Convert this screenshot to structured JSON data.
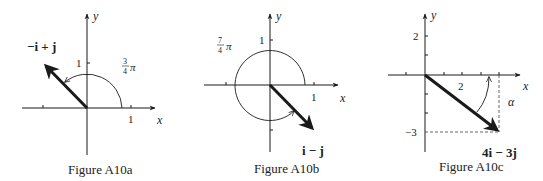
{
  "figures": [
    {
      "caption": "Figure A10a",
      "axis_x": "x",
      "axis_y": "y",
      "tick_x": "1",
      "tick_y": "1",
      "vector_label": "−i + j",
      "angle_num": "3",
      "angle_den": "4",
      "angle_pi": "π",
      "vector": [
        -1,
        1
      ],
      "angle": "3/4 π"
    },
    {
      "caption": "Figure A10b",
      "axis_x": "x",
      "axis_y": "y",
      "tick_x": "1",
      "tick_y": "1",
      "vector_label": "i − j",
      "angle_num": "7",
      "angle_den": "4",
      "angle_pi": "π",
      "vector": [
        1,
        -1
      ],
      "angle": "7/4 π"
    },
    {
      "caption": "Figure A10c",
      "axis_x": "x",
      "axis_y": "y",
      "tick_x": "2",
      "tick_y_pos": "2",
      "tick_y_neg": "−3",
      "vector_label": "4i − 3j",
      "angle_label": "α",
      "vector": [
        4,
        -3
      ]
    }
  ],
  "colors": {
    "ink": "#1a1a1a",
    "dashed": "#555555"
  }
}
